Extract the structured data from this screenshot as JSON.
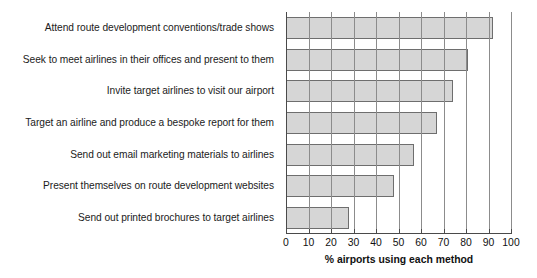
{
  "chart_data": {
    "type": "bar",
    "orientation": "horizontal",
    "title": "",
    "xlabel": "% airports using each method",
    "ylabel": "",
    "xlim": [
      0,
      100
    ],
    "xticks": [
      0,
      10,
      20,
      30,
      40,
      50,
      60,
      70,
      80,
      90,
      100
    ],
    "grid": true,
    "grid_axis": "x",
    "legend": false,
    "categories": [
      "Attend route development conventions/trade shows",
      "Seek to meet airlines in their offices and present to them",
      "Invite target airlines to visit our airport",
      "Target an airline and produce a bespoke report for them",
      "Send out email marketing materials to airlines",
      "Present themselves on route development websites",
      "Send out printed brochures to target airlines"
    ],
    "values": [
      92,
      81,
      74,
      67,
      57,
      48,
      28
    ],
    "bar_color": "#d6d6d6",
    "bar_edge_color": "#6e6e6e",
    "background_color": "#ffffff"
  }
}
